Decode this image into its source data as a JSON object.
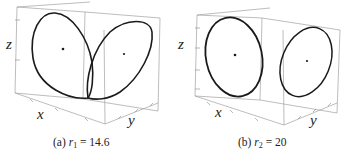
{
  "figure": {
    "panels": [
      {
        "id": "a",
        "caption_prefix": "(a) ",
        "param_symbol": "r",
        "param_subscript": "1",
        "param_rest": " = 14.6",
        "caption": "(a) r1 = 14.6",
        "axes": {
          "x": "x",
          "y": "y",
          "z": "z"
        },
        "description": "Two lobes of a periodic orbit joined at a pinch point; a fixed point marked inside each lobe"
      },
      {
        "id": "b",
        "caption_prefix": "(b) ",
        "param_symbol": "r",
        "param_subscript": "2",
        "param_rest": " = 20",
        "caption": "(b) r2 = 20",
        "axes": {
          "x": "x",
          "y": "y",
          "z": "z"
        },
        "description": "Two separate closed orbits (limit cycles), each around a fixed point"
      }
    ]
  },
  "colors": {
    "curve": "#1a1a1a",
    "box": "#9a9a9a",
    "text": "#222222",
    "background": "#ffffff"
  }
}
